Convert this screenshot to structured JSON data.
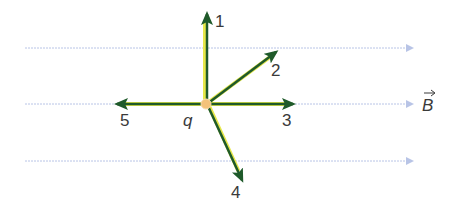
{
  "diagram": {
    "charge_label": "q",
    "field_label": "B",
    "field_line_color": "#b8c4e6",
    "vector_color": "#1f5a2a",
    "highlight_color": "#e6e84a",
    "charge_color": "#f4c27a",
    "vectors": [
      {
        "id": "1",
        "label": "1",
        "direction": "up"
      },
      {
        "id": "2",
        "label": "2",
        "direction": "up-right"
      },
      {
        "id": "3",
        "label": "3",
        "direction": "right"
      },
      {
        "id": "4",
        "label": "4",
        "direction": "down-right"
      },
      {
        "id": "5",
        "label": "5",
        "direction": "left"
      }
    ]
  }
}
